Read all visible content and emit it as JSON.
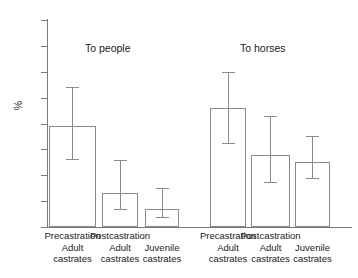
{
  "chart_data": {
    "type": "bar",
    "title": "",
    "xlabel": "",
    "ylabel": "%",
    "ylim": [
      0,
      80
    ],
    "yticks": [
      0,
      10,
      20,
      30,
      40,
      50,
      60,
      70,
      80
    ],
    "grid": false,
    "legend": null,
    "error_bar_type": "95% confidence interval",
    "groups": [
      {
        "name": "To people"
      },
      {
        "name": "To horses"
      }
    ],
    "categories": [
      "Precastration Adult castrates",
      "Postcastration Adult castrates",
      "Juvenile castrates",
      "Precastration Adult castrates",
      "Postcastration Adult castrates",
      "Juvenile castrates"
    ],
    "values": [
      39,
      13,
      7,
      46,
      28,
      25
    ],
    "err_low": [
      26,
      6.5,
      3.5,
      32,
      17,
      18.5
    ],
    "err_high": [
      54,
      26,
      15,
      60,
      43,
      35
    ],
    "bars": [
      {
        "group": "To people",
        "label_line1": "Precastration",
        "label_line2": "Adult",
        "label_line3": "castrates",
        "value": 39,
        "ci_low": 26,
        "ci_high": 54
      },
      {
        "group": "To people",
        "label_line1": "Postcastration",
        "label_line2": "Adult",
        "label_line3": "castrates",
        "value": 13,
        "ci_low": 6.5,
        "ci_high": 26
      },
      {
        "group": "To people",
        "label_line1": "",
        "label_line2": "Juvenile",
        "label_line3": "castrates",
        "value": 7,
        "ci_low": 3.5,
        "ci_high": 15
      },
      {
        "group": "To horses",
        "label_line1": "Precastration",
        "label_line2": "Adult",
        "label_line3": "castrates",
        "value": 46,
        "ci_low": 32,
        "ci_high": 60
      },
      {
        "group": "To horses",
        "label_line1": "Postcastration",
        "label_line2": "Adult",
        "label_line3": "castrates",
        "value": 28,
        "ci_low": 17,
        "ci_high": 43
      },
      {
        "group": "To horses",
        "label_line1": "",
        "label_line2": "Juvenile",
        "label_line3": "castrates",
        "value": 25,
        "ci_low": 18.5,
        "ci_high": 35
      }
    ],
    "colors": {
      "bar_fill": "#ffffff",
      "bar_edge": "#8a8a8a",
      "axis": "#7a7a7a",
      "text": "#1a1a1a",
      "background": "#ffffff"
    }
  },
  "axis": {
    "y_title": "%",
    "y_tick_labels": [
      "0",
      "10",
      "20",
      "30",
      "40",
      "50",
      "60",
      "70",
      "80"
    ]
  },
  "group_titles": [
    "To people",
    "To horses"
  ],
  "x_labels": [
    {
      "l1": "Precastration",
      "l2": "Adult",
      "l3": "castrates"
    },
    {
      "l1": "Postcastration",
      "l2": "Adult",
      "l3": "castrates"
    },
    {
      "l1": "",
      "l2": "Juvenile",
      "l3": "castrates"
    },
    {
      "l1": "Precastration",
      "l2": "Adult",
      "l3": "castrates"
    },
    {
      "l1": "Postcastration",
      "l2": "Adult",
      "l3": "castrates"
    },
    {
      "l1": "",
      "l2": "Juvenile",
      "l3": "castrates"
    }
  ]
}
